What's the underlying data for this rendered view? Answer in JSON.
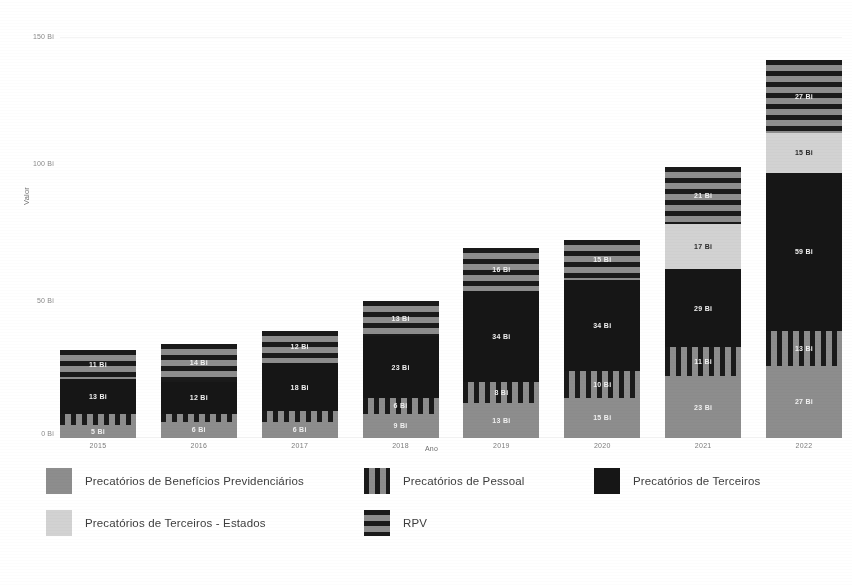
{
  "chart_data": {
    "type": "bar",
    "subtype": "stacked-bar",
    "title": "",
    "xlabel": "Ano",
    "ylabel": "Valor",
    "categories": [
      "2015",
      "2016",
      "2017",
      "2018",
      "2019",
      "2020",
      "2021",
      "2022"
    ],
    "ylim": [
      0,
      150
    ],
    "yticks": [
      0,
      50,
      100,
      150
    ],
    "ytick_labels": [
      "0 Bi",
      "50 Bi",
      "100 Bi",
      "150 Bi"
    ],
    "unit": "Bi",
    "grid": false,
    "legend_position": "bottom",
    "series": [
      {
        "name": "Precatórios de Benefícios Previdenciários",
        "pattern": "solid-gray",
        "color": "#8d8d8d",
        "values": [
          5,
          6,
          6,
          9,
          13,
          15,
          23,
          27
        ],
        "labels": [
          "5 Bi",
          "6 Bi",
          "6 Bi",
          "9 Bi",
          "13 Bi",
          "15 Bi",
          "23 Bi",
          "27 Bi"
        ]
      },
      {
        "name": "Precatórios de Pessoal",
        "pattern": "vertical-stripes",
        "color": "#1a1a1a",
        "values": [
          4,
          3,
          4,
          6,
          8,
          10,
          11,
          13
        ],
        "labels": [
          "4 Bi",
          "3 Bi",
          "4 Bi",
          "6 Bi",
          "8 Bi",
          "10 Bi",
          "11 Bi",
          "13 Bi"
        ]
      },
      {
        "name": "Precatórios de Terceiros",
        "pattern": "solid-black",
        "color": "#161616",
        "values": [
          13,
          12,
          18,
          23,
          34,
          34,
          29,
          59
        ],
        "labels": [
          "13 Bi",
          "12 Bi",
          "18 Bi",
          "23 Bi",
          "34 Bi",
          "34 Bi",
          "29 Bi",
          "59 Bi"
        ]
      },
      {
        "name": "Precatórios de Terceiros - Estados",
        "pattern": "solid-light-gray",
        "color": "#d2d2d2",
        "values": [
          0,
          0,
          0,
          0,
          0,
          0,
          17,
          15
        ],
        "labels": [
          "",
          "",
          "",
          "",
          "",
          "",
          "17 Bi",
          "15 Bi"
        ]
      },
      {
        "name": "RPV",
        "pattern": "horizontal-stripes",
        "color": "#1a1a1a",
        "values": [
          11,
          14,
          12,
          13,
          16,
          15,
          21,
          27
        ],
        "labels": [
          "11 Bi",
          "14 Bi",
          "12 Bi",
          "13 Bi",
          "16 Bi",
          "15 Bi",
          "21 Bi",
          "27 Bi"
        ]
      }
    ],
    "totals": [
      33,
      35,
      40,
      51,
      71,
      74,
      101,
      141
    ]
  },
  "axes": {
    "y_title": "Valor",
    "x_title": "Ano",
    "y_tick_0": "0 Bi",
    "y_tick_1": "50 Bi",
    "y_tick_2": "100 Bi",
    "y_tick_3": "150 Bi"
  },
  "legend": {
    "items": [
      {
        "label": "Precatórios de Benefícios Previdenciários",
        "swatch": "swatch-previdenciarios"
      },
      {
        "label": "Precatórios de Pessoal",
        "swatch": "swatch-pessoal"
      },
      {
        "label": "Precatórios de Terceiros",
        "swatch": "swatch-terceiros"
      },
      {
        "label": "Precatórios de Terceiros - Estados",
        "swatch": "swatch-terceiros-estados"
      },
      {
        "label": "RPV",
        "swatch": "swatch-rpv"
      }
    ]
  },
  "xlabels": {
    "c0": "2015",
    "c1": "2016",
    "c2": "2017",
    "c3": "2018",
    "c4": "2019",
    "c5": "2020",
    "c6": "2021",
    "c7": "2022"
  }
}
